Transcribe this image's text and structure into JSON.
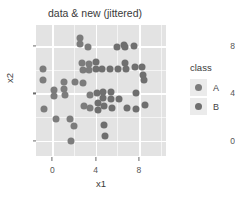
{
  "chart_data": {
    "type": "scatter",
    "title": "data & new (jittered)",
    "xlabel": "x1",
    "ylabel": "x2",
    "xlim": [
      -1.5,
      10.5
    ],
    "ylim": [
      -1.3,
      9.8
    ],
    "xticks": [
      0,
      4,
      8
    ],
    "yticks": [
      0,
      4,
      8
    ],
    "grid": true,
    "legend": {
      "title": "class",
      "position": "right",
      "entries": [
        {
          "label": "A",
          "color": "#7c7c7c"
        },
        {
          "label": "B",
          "color": "#6f6f6f"
        }
      ]
    },
    "panel_background": "#e3e3e3",
    "gridline_color": "#ffffff",
    "point_color": "#7e7e7e",
    "series": [
      {
        "name": "A",
        "color": "#7c7c7c",
        "points": [
          [
            -0.9,
            6.1
          ],
          [
            -0.9,
            5.1
          ],
          [
            -0.8,
            2.7
          ],
          [
            0.2,
            4.3
          ],
          [
            0.2,
            3.8
          ],
          [
            0.3,
            1.8
          ],
          [
            1.1,
            5.0
          ],
          [
            1.1,
            4.4
          ],
          [
            1.2,
            3.9
          ],
          [
            1.6,
            1.8
          ],
          [
            1.7,
            0.0
          ],
          [
            2.0,
            1.2
          ],
          [
            2.1,
            5.0
          ],
          [
            2.6,
            8.7
          ],
          [
            2.6,
            8.2
          ],
          [
            2.7,
            6.6
          ],
          [
            2.8,
            6.0
          ],
          [
            2.8,
            4.9
          ],
          [
            2.9,
            2.9
          ],
          [
            3.3,
            7.9
          ],
          [
            3.4,
            6.5
          ],
          [
            3.4,
            6.0
          ],
          [
            3.5,
            3.9
          ],
          [
            3.5,
            2.8
          ]
        ]
      },
      {
        "name": "B",
        "color": "#6f6f6f",
        "points": [
          [
            4.0,
            6.7
          ],
          [
            4.0,
            6.1
          ],
          [
            4.1,
            4.0
          ],
          [
            4.2,
            3.2
          ],
          [
            4.2,
            2.6
          ],
          [
            4.6,
            6.1
          ],
          [
            4.7,
            4.1
          ],
          [
            4.7,
            3.6
          ],
          [
            4.8,
            2.9
          ],
          [
            4.8,
            1.3
          ],
          [
            4.9,
            0.4
          ],
          [
            5.3,
            6.1
          ],
          [
            5.4,
            4.1
          ],
          [
            5.4,
            3.5
          ],
          [
            5.5,
            2.8
          ],
          [
            6.0,
            7.9
          ],
          [
            6.1,
            6.1
          ],
          [
            6.2,
            3.5
          ],
          [
            6.6,
            8.1
          ],
          [
            6.7,
            7.9
          ],
          [
            6.7,
            6.6
          ],
          [
            6.8,
            6.1
          ],
          [
            6.9,
            2.8
          ],
          [
            7.5,
            8.0
          ],
          [
            7.6,
            6.2
          ],
          [
            7.7,
            4.0
          ],
          [
            7.7,
            2.7
          ],
          [
            8.3,
            6.2
          ],
          [
            8.4,
            5.6
          ],
          [
            8.5,
            5.1
          ],
          [
            8.6,
            3.0
          ]
        ]
      }
    ]
  }
}
